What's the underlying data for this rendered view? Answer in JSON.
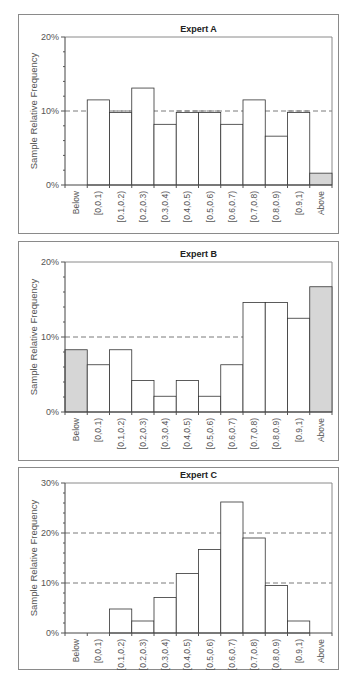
{
  "chart_data": [
    {
      "type": "bar",
      "title": "Expert A",
      "xlabel": "",
      "ylabel": "Sample Relative Frequency",
      "ylim": [
        0,
        20
      ],
      "yticks": [
        "0%",
        "10%",
        "20%"
      ],
      "reference_lines": [
        10
      ],
      "categories": [
        "Below",
        "[0,0.1)",
        "[0.1,0.2)",
        "[0.2,0.3)",
        "[0.3,0.4)",
        "[0.4,0.5)",
        "[0.5,0.6)",
        "[0.6,0.7)",
        "[0.7,0.8)",
        "[0.8,0.9)",
        "[0.9,1)",
        "Above"
      ],
      "values": [
        0,
        11.5,
        9.8,
        13.1,
        8.2,
        9.8,
        9.8,
        8.2,
        11.5,
        6.6,
        9.8,
        1.6
      ],
      "shaded": [
        "Below",
        "Above"
      ],
      "grid": false
    },
    {
      "type": "bar",
      "title": "Expert B",
      "xlabel": "",
      "ylabel": "Sample Relative Frequency",
      "ylim": [
        0,
        20
      ],
      "yticks": [
        "0%",
        "10%",
        "20%"
      ],
      "reference_lines": [
        10
      ],
      "categories": [
        "Below",
        "[0,0.1)",
        "[0.1,0.2)",
        "[0.2,0.3)",
        "[0.3,0.4)",
        "[0.4,0.5)",
        "[0.5,0.6)",
        "[0.6,0.7)",
        "[0.7,0.8)",
        "[0.8,0.9)",
        "[0.9,1)",
        "Above"
      ],
      "values": [
        8.3,
        6.3,
        8.3,
        4.2,
        2.1,
        4.2,
        2.1,
        6.3,
        14.6,
        14.6,
        12.5,
        16.7
      ],
      "shaded": [
        "Below",
        "Above"
      ],
      "grid": false
    },
    {
      "type": "bar",
      "title": "Expert C",
      "xlabel": "",
      "ylabel": "Sample Relative Frequency",
      "ylim": [
        0,
        30
      ],
      "yticks": [
        "0%",
        "10%",
        "20%",
        "30%"
      ],
      "reference_lines": [
        10,
        20
      ],
      "categories": [
        "Below",
        "[0,0.1)",
        "[0.1,0.2)",
        "[0.2,0.3)",
        "[0.3,0.4)",
        "[0.4,0.5)",
        "[0.5,0.6)",
        "[0.6,0.7)",
        "[0.7,0.8)",
        "[0.8,0.9)",
        "[0.9,1)",
        "Above"
      ],
      "values": [
        0,
        0,
        4.8,
        2.4,
        7.1,
        11.9,
        16.7,
        26.2,
        19.0,
        9.5,
        2.4,
        0
      ],
      "shaded": [
        "Below",
        "Above"
      ],
      "grid": false
    }
  ],
  "colors": {
    "bar_fill": "#ffffff",
    "shaded_fill": "#d6d6d6",
    "bar_stroke": "#333333",
    "reference_line": "#7a7a7a",
    "frame": "#8a8a8a"
  }
}
